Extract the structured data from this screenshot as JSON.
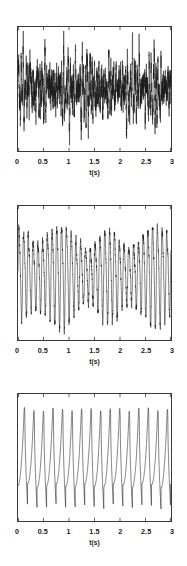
{
  "figure": {
    "background_color": "#ffffff",
    "line_color": "#1a1a1a",
    "frame_color": "#3a3a3a",
    "panel_count": 3
  },
  "chart_data": [
    {
      "type": "line",
      "title": "",
      "xlabel": "t(s)",
      "ylabel": "",
      "xlim": [
        0,
        3
      ],
      "ylim": [
        -1.15,
        1.15
      ],
      "grid": false,
      "legend": null,
      "xticks": [
        0,
        0.5,
        1,
        1.5,
        2,
        2.5,
        3
      ],
      "xticklabels": [
        "0",
        "0.5",
        "1",
        "1.5",
        "2",
        "2.5",
        "3"
      ],
      "yticks": [],
      "yticklabels": [],
      "description": "Broadband chaotic / noisy oscillation, dense high-frequency content",
      "series": [
        {
          "name": "signal",
          "carrier_hz": 21.5,
          "modulation_hz": 2.3,
          "noise_amplitude": 0.55,
          "seed": 11,
          "samples": 2400
        }
      ]
    },
    {
      "type": "line",
      "title": "",
      "xlabel": "t(s)",
      "ylabel": "",
      "xlim": [
        0,
        3
      ],
      "ylim": [
        -1.15,
        1.15
      ],
      "grid": false,
      "legend": null,
      "xticks": [
        0,
        0.5,
        1,
        1.5,
        2,
        2.5,
        3
      ],
      "xticklabels": [
        "0",
        "0.5",
        "1",
        "1.5",
        "2",
        "2.5",
        "3"
      ],
      "yticks": [],
      "yticklabels": [],
      "description": "Quasi-periodic oscillation, about 32 cycles over 3 s with amplitude modulation",
      "series": [
        {
          "name": "signal",
          "carrier_hz": 10.7,
          "modulation_hz": 1.1,
          "noise_amplitude": 0.16,
          "seed": 29,
          "samples": 2400
        }
      ]
    },
    {
      "type": "line",
      "title": "",
      "xlabel": "t(s)",
      "ylabel": "",
      "xlim": [
        0,
        3
      ],
      "ylim": [
        -1.15,
        1.15
      ],
      "grid": false,
      "legend": null,
      "xticks": [
        0,
        0.5,
        1,
        1.5,
        2,
        2.5,
        3
      ],
      "xticklabels": [
        "0",
        "0.5",
        "1",
        "1.5",
        "2",
        "2.5",
        "3"
      ],
      "yticks": [],
      "yticklabels": [],
      "description": "Periodic relaxation oscillation, about 16 sharp spikes over 3 s",
      "series": [
        {
          "name": "signal",
          "carrier_hz": 5.35,
          "modulation_hz": 0.0,
          "noise_amplitude": 0.05,
          "seed": 7,
          "samples": 2400
        }
      ]
    }
  ]
}
